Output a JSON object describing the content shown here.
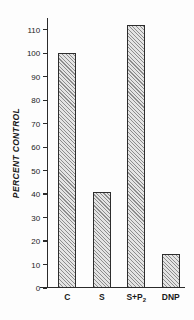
{
  "chart_data": {
    "type": "bar",
    "title": "",
    "xlabel": "",
    "ylabel": "PERCENT CONTROL",
    "categories": [
      "C",
      "S",
      "S+P2",
      "DNP"
    ],
    "category_labels_display": [
      "C",
      "S",
      "S+P",
      "DNP"
    ],
    "values": [
      100,
      41,
      112,
      14.5
    ],
    "ylim": [
      0,
      115
    ],
    "yticks": [
      0,
      10,
      20,
      30,
      40,
      50,
      60,
      70,
      80,
      90,
      100,
      110
    ],
    "ytick_labels": [
      "0",
      "10",
      "20",
      "30",
      "40",
      "50",
      "60",
      "70",
      "80",
      "90",
      "100",
      "110"
    ],
    "grid": false,
    "legend": null,
    "bar_style": {
      "fill": "diagonal-hatch",
      "hatch_color": "#8d8d8d",
      "face_color": "#e4e4e4",
      "edge_color": "#2d2d2d"
    },
    "axis_color": "#2b2b2b",
    "background_color": "#fdfdfd",
    "subscripts": {
      "S+P2": "2"
    }
  }
}
